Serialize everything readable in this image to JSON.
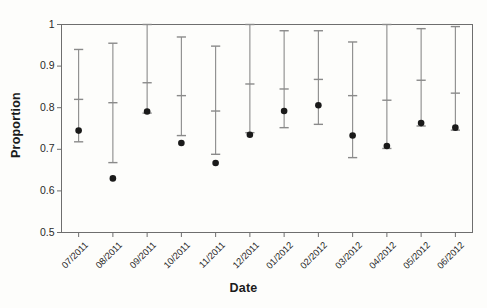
{
  "chart_data": {
    "type": "scatter",
    "title": "",
    "xlabel": "Date",
    "ylabel": "Proportion",
    "categories": [
      "07/2011",
      "08/2011",
      "09/2011",
      "10/2011",
      "11/2011",
      "12/2011",
      "01/2012",
      "02/2012",
      "03/2012",
      "04/2012",
      "05/2012",
      "06/2012"
    ],
    "ylim": [
      0.5,
      1.0
    ],
    "ytick_labels": [
      "0.5",
      "0.6",
      "0.7",
      "0.8",
      "0.9",
      "1"
    ],
    "ytick_values": [
      0.5,
      0.6,
      0.7,
      0.8,
      0.9,
      1.0
    ],
    "grid": false,
    "legend": "none",
    "series": [
      {
        "name": "Proportion",
        "marker": "filled-circle",
        "color": "#1a1a1a",
        "values": [
          0.745,
          0.63,
          0.791,
          0.715,
          0.667,
          0.735,
          0.792,
          0.806,
          0.733,
          0.708,
          0.763,
          0.752
        ]
      }
    ],
    "error_bars": {
      "mid_tick_values": [
        0.82,
        0.812,
        0.86,
        0.829,
        0.792,
        0.857,
        0.845,
        0.868,
        0.829,
        0.818,
        0.866,
        0.835
      ],
      "upper": [
        0.94,
        0.955,
        1.0,
        0.97,
        0.948,
        1.0,
        0.985,
        0.985,
        0.958,
        1.0,
        0.99,
        0.995
      ],
      "lower": [
        0.718,
        0.668,
        0.787,
        0.733,
        0.688,
        0.74,
        0.752,
        0.76,
        0.68,
        0.702,
        0.756,
        0.746
      ]
    }
  },
  "axis": {
    "y_title": "Proportion",
    "x_title": "Date"
  }
}
